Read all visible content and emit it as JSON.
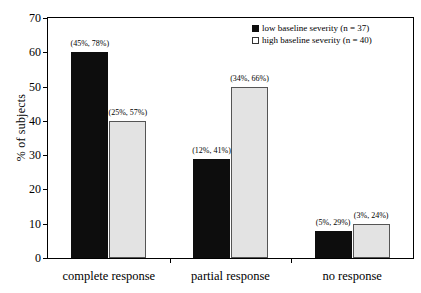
{
  "chart_data": {
    "type": "bar",
    "title": "",
    "xlabel": "",
    "ylabel": "% of subjects",
    "ylim": [
      0,
      70
    ],
    "ytick_step": 10,
    "yticks": [
      0,
      10,
      20,
      30,
      40,
      50,
      60,
      70
    ],
    "grid": false,
    "legend_position": "top-right",
    "categories": [
      "complete response",
      "partial response",
      "no response"
    ],
    "series": [
      {
        "name": "low baseline severity (n = 37)",
        "swatch": "filled-black",
        "color": "#0d0d0d",
        "values": [
          60,
          29,
          8
        ],
        "point_labels": [
          "(45%, 78%)",
          "(12%, 41%)",
          "(5%, 29%)"
        ]
      },
      {
        "name": "high baseline severity (n = 40)",
        "swatch": "open-white",
        "color": "#e3e3e3",
        "values": [
          40,
          50,
          10
        ],
        "point_labels": [
          "(25%, 57%)",
          "(34%, 66%)",
          "(3%, 24%)"
        ]
      }
    ]
  },
  "axes": {
    "y_title": "% of subjects",
    "y_tick_labels": [
      "0",
      "10",
      "20",
      "30",
      "40",
      "50",
      "60",
      "70"
    ],
    "x_tick_labels": [
      "complete response",
      "partial response",
      "no response"
    ]
  },
  "legend": {
    "entries": [
      {
        "label": "low baseline severity (n = 37)"
      },
      {
        "label": "high baseline severity (n = 40)"
      }
    ]
  },
  "annotations": {
    "complete_low": "(45%, 78%)",
    "complete_high": "(25%, 57%)",
    "partial_low": "(12%, 41%)",
    "partial_high": "(34%, 66%)",
    "none_low": "(5%, 29%)",
    "none_high": "(3%, 24%)"
  }
}
